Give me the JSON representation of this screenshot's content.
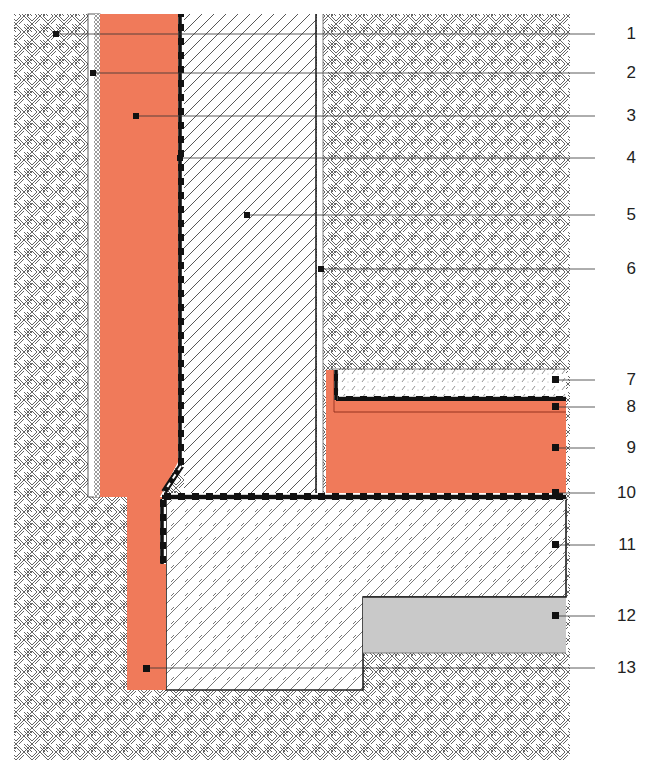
{
  "diagram": {
    "type": "construction cross-section detail",
    "colors": {
      "insulation": "#f07a5a",
      "gravel": "#c9c9c9",
      "membrane": "#111111",
      "line": "#333333",
      "background": "#ffffff"
    },
    "labels": [
      {
        "number": "1",
        "layer": "soil",
        "y": 34
      },
      {
        "number": "2",
        "layer": "protective layer",
        "y": 73
      },
      {
        "number": "3",
        "layer": "perimeter insulation (wall)",
        "y": 116
      },
      {
        "number": "4",
        "layer": "waterproofing (wall)",
        "y": 158
      },
      {
        "number": "5",
        "layer": "basement wall",
        "y": 215
      },
      {
        "number": "6",
        "layer": "interior plaster",
        "y": 269
      },
      {
        "number": "7",
        "layer": "screed",
        "y": 380
      },
      {
        "number": "8",
        "layer": "impact sound insulation",
        "y": 407
      },
      {
        "number": "9",
        "layer": "thermal insulation (floor)",
        "y": 448
      },
      {
        "number": "10",
        "layer": "waterproofing (floor)",
        "y": 493
      },
      {
        "number": "11",
        "layer": "floor slab",
        "y": 545
      },
      {
        "number": "12",
        "layer": "gravel layer",
        "y": 616
      },
      {
        "number": "13",
        "layer": "perimeter insulation (footing edge)",
        "y": 668
      }
    ]
  }
}
